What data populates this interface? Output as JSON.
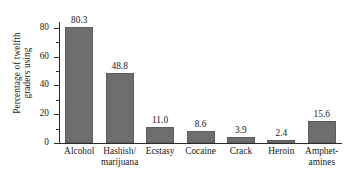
{
  "chart_data": {
    "type": "bar",
    "title": "",
    "xlabel": "",
    "ylabel": "Percentage of twelfth graders using",
    "ylabel_lines": [
      "Percentage of twelfth",
      "graders using"
    ],
    "categories": [
      "Alcohol",
      "Hashish/ marijuana",
      "Ecstasy",
      "Cocaine",
      "Crack",
      "Heroin",
      "Amphet- amines"
    ],
    "category_lines": [
      [
        "Alcohol"
      ],
      [
        "Hashish/",
        "marijuana"
      ],
      [
        "Ecstasy"
      ],
      [
        "Cocaine"
      ],
      [
        "Crack"
      ],
      [
        "Heroin"
      ],
      [
        "Amphet-",
        "amines"
      ]
    ],
    "values": [
      80.3,
      48.8,
      11.0,
      8.6,
      3.9,
      2.4,
      15.6
    ],
    "value_labels": [
      "80.3",
      "48.8",
      "11.0",
      "8.6",
      "3.9",
      "2.4",
      "15.6"
    ],
    "ylim": [
      0,
      84
    ],
    "y_ticks": [
      0,
      20,
      40,
      60,
      80
    ],
    "y_tick_labels": [
      "0",
      "20",
      "40",
      "60",
      "80"
    ],
    "y_minor_ticks": [
      10,
      30,
      50,
      70
    ],
    "grid": false,
    "legend": "none",
    "bar_color": "#6e6e6e",
    "axis_color": "#2b2b2b",
    "background": "#ffffff"
  }
}
